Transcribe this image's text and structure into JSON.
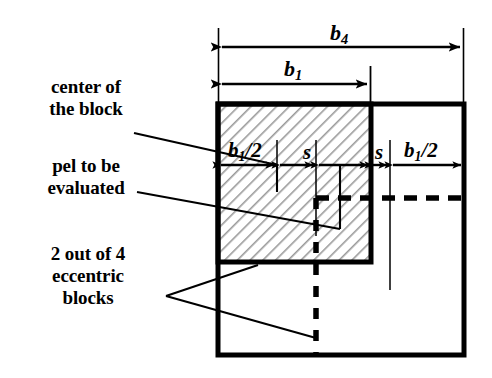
{
  "figure": {
    "annotations": [
      {
        "id": "center-of-block",
        "text": "center of\nthe block"
      },
      {
        "id": "pel-to-be-evaluated",
        "text": "pel to be\nevaluated"
      },
      {
        "id": "eccentric-blocks",
        "text": "2 out of 4\neccentric\nblocks"
      }
    ],
    "dimensions": {
      "b4": {
        "symbol": "b",
        "subscript": "4",
        "label": "b4"
      },
      "b1": {
        "symbol": "b",
        "subscript": "1",
        "label": "b1"
      },
      "b1_half_left": {
        "symbol": "b",
        "subscript": "1",
        "suffix": "/2",
        "label": "b1/2"
      },
      "s_left": {
        "symbol": "s",
        "label": "s"
      },
      "s_right": {
        "symbol": "s",
        "label": "s"
      },
      "b1_half_right": {
        "symbol": "b",
        "subscript": "1",
        "suffix": "/2",
        "label": "b1/2"
      }
    },
    "colors": {
      "stroke": "#000000",
      "background": "#ffffff",
      "hatch": "#8d8d8d",
      "hatch_fill": "#ffffff"
    },
    "geometry": {
      "outer_block": {
        "x": 218,
        "y": 104,
        "width": 246,
        "height": 251
      },
      "hatched_block": {
        "x": 218,
        "y": 104,
        "width": 153,
        "height": 158
      },
      "center_pel": {
        "x": 316,
        "y": 198
      },
      "dim_row_y": 164,
      "ticks_x": [
        218,
        277,
        316,
        371,
        390,
        464
      ]
    }
  }
}
